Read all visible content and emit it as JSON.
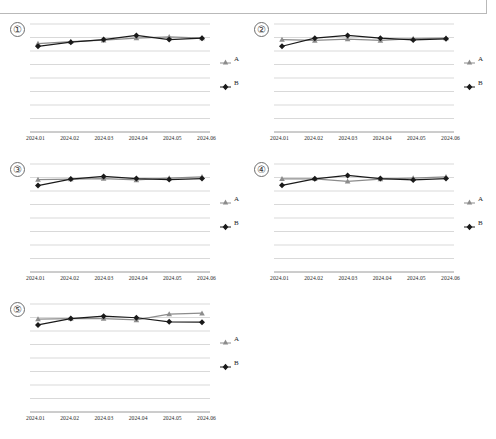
{
  "header": {
    "box_label": ""
  },
  "legend": {
    "series_a_label": "A",
    "series_b_label": "B",
    "a_marker_icon": "triangle-marker-icon",
    "b_marker_icon": "diamond-marker-icon"
  },
  "colors": {
    "series_a": "#8c8c8c",
    "series_b": "#1a1a1a",
    "gridline": "#c9c9c9",
    "axis": "#9a9a9a",
    "text": "#1e1e1e"
  },
  "panels": [
    {
      "index_label": "①"
    },
    {
      "index_label": "②"
    },
    {
      "index_label": "③"
    },
    {
      "index_label": "④"
    },
    {
      "index_label": "⑤"
    }
  ],
  "chart_data": [
    {
      "id": "chart-1",
      "type": "line",
      "title": "①",
      "xlabel": "",
      "ylabel": "",
      "grid": true,
      "gridlines": 8,
      "legend_position": "right",
      "ylim": [
        0,
        8
      ],
      "categories": [
        "2024.01",
        "2024.02",
        "2024.03",
        "2024.04",
        "2024.05",
        "2024.06"
      ],
      "series": [
        {
          "name": "A",
          "values": [
            6.55,
            6.7,
            6.8,
            6.95,
            7.05,
            6.95
          ]
        },
        {
          "name": "B",
          "values": [
            6.35,
            6.65,
            6.85,
            7.15,
            6.85,
            6.95
          ]
        }
      ]
    },
    {
      "id": "chart-2",
      "type": "line",
      "title": "②",
      "xlabel": "",
      "ylabel": "",
      "grid": true,
      "gridlines": 8,
      "legend_position": "right",
      "ylim": [
        0,
        8
      ],
      "categories": [
        "2024.01",
        "2024.02",
        "2024.03",
        "2024.04",
        "2024.05",
        "2024.06"
      ],
      "series": [
        {
          "name": "A",
          "values": [
            6.85,
            6.78,
            6.88,
            6.78,
            6.92,
            6.95
          ]
        },
        {
          "name": "B",
          "values": [
            6.35,
            6.95,
            7.15,
            6.95,
            6.82,
            6.9
          ]
        }
      ]
    },
    {
      "id": "chart-3",
      "type": "line",
      "title": "③",
      "xlabel": "",
      "ylabel": "",
      "grid": true,
      "gridlines": 8,
      "legend_position": "right",
      "ylim": [
        0,
        8
      ],
      "categories": [
        "2024.01",
        "2024.02",
        "2024.03",
        "2024.04",
        "2024.05",
        "2024.06"
      ],
      "series": [
        {
          "name": "A",
          "values": [
            6.85,
            6.88,
            6.92,
            6.82,
            6.95,
            7.05
          ]
        },
        {
          "name": "B",
          "values": [
            6.4,
            6.88,
            7.08,
            6.92,
            6.85,
            6.92
          ]
        }
      ]
    },
    {
      "id": "chart-4",
      "type": "line",
      "title": "④",
      "xlabel": "",
      "ylabel": "",
      "grid": true,
      "gridlines": 8,
      "legend_position": "right",
      "ylim": [
        0,
        8
      ],
      "categories": [
        "2024.01",
        "2024.02",
        "2024.03",
        "2024.04",
        "2024.05",
        "2024.06"
      ],
      "series": [
        {
          "name": "A",
          "values": [
            6.9,
            6.9,
            6.72,
            6.88,
            6.95,
            7.05
          ]
        },
        {
          "name": "B",
          "values": [
            6.42,
            6.9,
            7.15,
            6.92,
            6.82,
            6.92
          ]
        }
      ]
    },
    {
      "id": "chart-5",
      "type": "line",
      "title": "⑤",
      "xlabel": "",
      "ylabel": "",
      "grid": true,
      "gridlines": 8,
      "legend_position": "right",
      "ylim": [
        0,
        8
      ],
      "categories": [
        "2024.01",
        "2024.02",
        "2024.03",
        "2024.04",
        "2024.05",
        "2024.06"
      ],
      "series": [
        {
          "name": "A",
          "values": [
            6.88,
            6.92,
            6.92,
            6.82,
            7.25,
            7.32
          ]
        },
        {
          "name": "B",
          "values": [
            6.45,
            6.92,
            7.1,
            6.98,
            6.68,
            6.65
          ]
        }
      ]
    }
  ]
}
